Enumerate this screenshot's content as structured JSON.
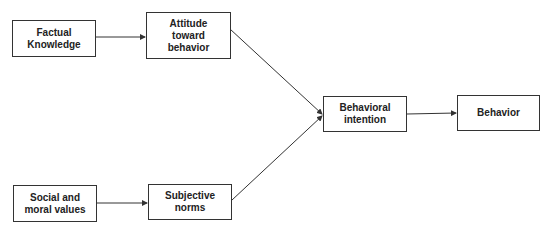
{
  "diagram": {
    "nodes": [
      {
        "id": "factual",
        "label": "Factual\nKnowledge"
      },
      {
        "id": "attitude",
        "label": "Attitude\ntoward\nbehavior"
      },
      {
        "id": "social",
        "label": "Social and\nmoral values"
      },
      {
        "id": "subjective",
        "label": "Subjective\nnorms"
      },
      {
        "id": "intention",
        "label": "Behavioral\nintention"
      },
      {
        "id": "behavior",
        "label": "Behavior"
      }
    ],
    "edges": [
      {
        "from": "factual",
        "to": "attitude"
      },
      {
        "from": "social",
        "to": "subjective"
      },
      {
        "from": "attitude",
        "to": "intention"
      },
      {
        "from": "subjective",
        "to": "intention"
      },
      {
        "from": "intention",
        "to": "behavior"
      }
    ]
  }
}
